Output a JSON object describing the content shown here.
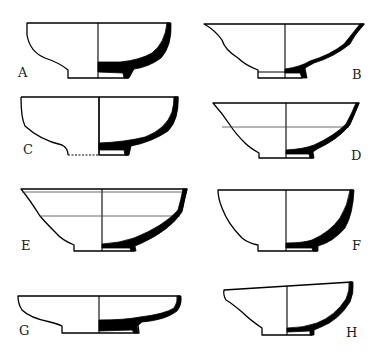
{
  "figure": {
    "vessels": [
      {
        "id": "A",
        "label": "A"
      },
      {
        "id": "B",
        "label": "B"
      },
      {
        "id": "C",
        "label": "C"
      },
      {
        "id": "D",
        "label": "D"
      },
      {
        "id": "E",
        "label": "E"
      },
      {
        "id": "F",
        "label": "F"
      },
      {
        "id": "G",
        "label": "G"
      },
      {
        "id": "H",
        "label": "H"
      }
    ]
  },
  "colors": {
    "line": "#000000",
    "background": "#ffffff",
    "section_fill": "#000000"
  }
}
